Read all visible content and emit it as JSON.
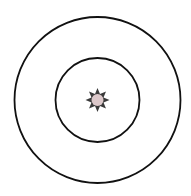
{
  "diagram": {
    "type": "concentric-circles",
    "background": "#ffffff",
    "center": {
      "x": 97.5,
      "y": 100
    },
    "stroke_color": "#111111",
    "circles": [
      {
        "name": "outer-ring",
        "r": 83,
        "stroke_width": 1.8
      },
      {
        "name": "inner-ring",
        "r": 42,
        "stroke_width": 1.8
      }
    ],
    "center_marker": {
      "icon": "sun-star-icon",
      "points": 8,
      "outer_r": 12,
      "inner_r": 6.5,
      "star_color": "#3a3a3a",
      "core_r": 6,
      "core_color": "#dcc8ca"
    }
  }
}
